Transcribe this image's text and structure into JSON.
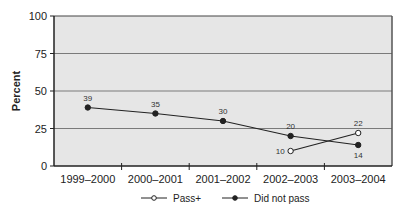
{
  "chart_data": {
    "type": "line",
    "title": "",
    "xlabel": "",
    "ylabel": "Percent",
    "ylim": [
      0,
      100
    ],
    "yticks": [
      0,
      25,
      50,
      75,
      100
    ],
    "grid": true,
    "legend_position": "bottom",
    "categories": [
      "1999–2000",
      "2000–2001",
      "2001–2002",
      "2002–2003",
      "2003–2004"
    ],
    "series": [
      {
        "name": "Pass+",
        "marker": "open-circle",
        "values": [
          null,
          null,
          null,
          10,
          22
        ]
      },
      {
        "name": "Did not pass",
        "marker": "filled-circle",
        "values": [
          39,
          35,
          30,
          20,
          14
        ]
      }
    ]
  },
  "colors": {
    "plot_background": "#e6e6e6",
    "gridline": "#7a7a7a",
    "axis": "#222222",
    "line": "#222222"
  }
}
